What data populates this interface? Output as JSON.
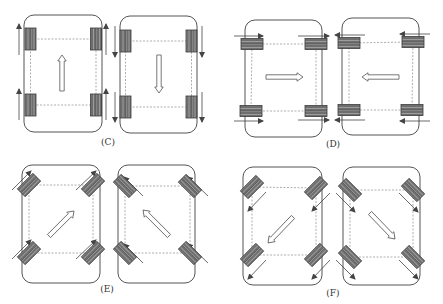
{
  "colors": {
    "frame": "#555555",
    "dashed": "#9a9a9a",
    "wheel_fill": "#6e6e6e",
    "wheel_stripe": "#9c9c9c",
    "wheel_stroke": "#3a3a3a",
    "motion_arrow": "#444444",
    "body_arrow_fill": "#ffffff",
    "body_arrow_stroke": "#555555"
  },
  "panels": [
    {
      "id": "C",
      "label": "(C)",
      "label_pos": [
        108,
        137
      ],
      "description": "Forward / backward motion, wheels straight",
      "robots": [
        {
          "frame": [
            24,
            15,
            78,
            117
          ],
          "wheel_angle": 0,
          "wheel_size": [
            11,
            22
          ],
          "wheels": [
            [
              30.5,
              39
            ],
            [
              96,
              39
            ],
            [
              30.5,
              105
            ],
            [
              96,
              105
            ]
          ],
          "motion_arrows": [
            {
              "from": [
                19,
                55
              ],
              "to": [
                19,
                24
              ]
            },
            {
              "from": [
                106,
                55
              ],
              "to": [
                106,
                24
              ]
            },
            {
              "from": [
                19,
                120
              ],
              "to": [
                19,
                89
              ]
            },
            {
              "from": [
                106,
                120
              ],
              "to": [
                106,
                89
              ]
            }
          ],
          "body_arrow": {
            "from": [
              62,
              91
            ],
            "to": [
              62,
              55
            ]
          }
        },
        {
          "frame": [
            120,
            16,
            77,
            117
          ],
          "wheel_angle": 0,
          "wheel_size": [
            11,
            22
          ],
          "wheels": [
            [
              125.5,
              41
            ],
            [
              191.5,
              41
            ],
            [
              125.5,
              107
            ],
            [
              191.5,
              107
            ]
          ],
          "motion_arrows": [
            {
              "from": [
                115,
                26
              ],
              "to": [
                115,
                57
              ]
            },
            {
              "from": [
                202,
                26
              ],
              "to": [
                202,
                57
              ]
            },
            {
              "from": [
                115,
                92
              ],
              "to": [
                115,
                122
              ]
            },
            {
              "from": [
                202,
                92
              ],
              "to": [
                202,
                122
              ]
            }
          ],
          "body_arrow": {
            "from": [
              159,
              55
            ],
            "to": [
              159,
              93
            ]
          }
        }
      ]
    },
    {
      "id": "D",
      "label": "(D)",
      "label_pos": [
        333,
        139
      ],
      "description": "Sideways motion, wheels turned 90 degrees",
      "robots": [
        {
          "frame": [
            245,
            20,
            77,
            117
          ],
          "wheel_angle": 90,
          "wheel_size": [
            11,
            22
          ],
          "wheels": [
            [
              252,
              44
            ],
            [
              316,
              44
            ],
            [
              251,
              111
            ],
            [
              316,
              111
            ]
          ],
          "motion_arrows": [
            {
              "from": [
                234,
                36
              ],
              "to": [
                263,
                36
              ]
            },
            {
              "from": [
                298,
                36
              ],
              "to": [
                329,
                36
              ]
            },
            {
              "from": [
                234,
                121
              ],
              "to": [
                263,
                121
              ]
            },
            {
              "from": [
                298,
                120
              ],
              "to": [
                329,
                120
              ]
            }
          ],
          "body_arrow": {
            "from": [
              266,
              77
            ],
            "to": [
              303,
              77
            ]
          }
        },
        {
          "frame": [
            342,
            18,
            77,
            117
          ],
          "wheel_angle": 90,
          "wheel_size": [
            11,
            22
          ],
          "wheels": [
            [
              349,
              43
            ],
            [
              413,
              42
            ],
            [
              349,
              110
            ],
            [
              412,
              110
            ]
          ],
          "motion_arrows": [
            {
              "from": [
                365,
                35
              ],
              "to": [
                335,
                35
              ]
            },
            {
              "from": [
                430,
                34
              ],
              "to": [
                400,
                34
              ]
            },
            {
              "from": [
                365,
                120
              ],
              "to": [
                335,
                120
              ]
            },
            {
              "from": [
                430,
                121
              ],
              "to": [
                400,
                121
              ]
            }
          ],
          "body_arrow": {
            "from": [
              399,
              77
            ],
            "to": [
              362,
              77
            ]
          }
        }
      ]
    },
    {
      "id": "E",
      "label": "(E)",
      "label_pos": [
        107,
        284
      ],
      "description": "Diagonal forward motion, wheels at 45 degrees",
      "robots": [
        {
          "frame": [
            22,
            165,
            78,
            118
          ],
          "wheel_angle": 45,
          "wheel_size": [
            11,
            22
          ],
          "wheels": [
            [
              29,
              185
            ],
            [
              93,
              185
            ],
            [
              29,
              253
            ],
            [
              93,
              253
            ]
          ],
          "motion_arrows": [
            {
              "from": [
                12,
                190
              ],
              "to": [
                31,
                171
              ]
            },
            {
              "from": [
                76,
                190
              ],
              "to": [
                96,
                171
              ]
            },
            {
              "from": [
                12,
                259
              ],
              "to": [
                31,
                240
              ]
            },
            {
              "from": [
                76,
                259
              ],
              "to": [
                96,
                240
              ]
            }
          ],
          "body_arrow": {
            "from": [
              49,
              236
            ],
            "to": [
              74,
              211
            ]
          }
        },
        {
          "frame": [
            118,
            165,
            77,
            118
          ],
          "wheel_angle": -45,
          "wheel_size": [
            11,
            22
          ],
          "wheels": [
            [
              125,
              186
            ],
            [
              190,
              186
            ],
            [
              125,
              253
            ],
            [
              190,
              253
            ]
          ],
          "motion_arrows": [
            {
              "from": [
                143,
                196
              ],
              "to": [
                124,
                177
              ]
            },
            {
              "from": [
                208,
                196
              ],
              "to": [
                188,
                177
              ]
            },
            {
              "from": [
                143,
                263
              ],
              "to": [
                124,
                244
              ]
            },
            {
              "from": [
                208,
                263
              ],
              "to": [
                188,
                244
              ]
            }
          ],
          "body_arrow": {
            "from": [
              169,
              236
            ],
            "to": [
              143,
              210
            ]
          }
        }
      ]
    },
    {
      "id": "F",
      "label": "(F)",
      "label_pos": [
        333,
        288
      ],
      "description": "Diagonal backward motion, wheels at 45 degrees",
      "robots": [
        {
          "frame": [
            243,
            167,
            79,
            118
          ],
          "wheel_angle": 45,
          "wheel_size": [
            11,
            22
          ],
          "wheels": [
            [
              252,
              187
            ],
            [
              316,
              188
            ],
            [
              252,
              255
            ],
            [
              316,
              255
            ]
          ],
          "motion_arrows": [
            {
              "from": [
                266,
                192
              ],
              "to": [
                248,
                211
              ]
            },
            {
              "from": [
                330,
                193
              ],
              "to": [
                312,
                211
              ]
            },
            {
              "from": [
                266,
                260
              ],
              "to": [
                248,
                279
              ]
            },
            {
              "from": [
                330,
                260
              ],
              "to": [
                312,
                279
              ]
            }
          ],
          "body_arrow": {
            "from": [
              293,
              217
            ],
            "to": [
              268,
              243
            ]
          }
        },
        {
          "frame": [
            343,
            167,
            77,
            118
          ],
          "wheel_angle": -45,
          "wheel_size": [
            11,
            22
          ],
          "wheels": [
            [
              350,
              190
            ],
            [
              413,
              190
            ],
            [
              350,
              257
            ],
            [
              413,
              257
            ]
          ],
          "motion_arrows": [
            {
              "from": [
                336,
                193
              ],
              "to": [
                355,
                212
              ]
            },
            {
              "from": [
                399,
                193
              ],
              "to": [
                418,
                212
              ]
            },
            {
              "from": [
                336,
                260
              ],
              "to": [
                355,
                279
              ]
            },
            {
              "from": [
                399,
                260
              ],
              "to": [
                418,
                279
              ]
            }
          ],
          "body_arrow": {
            "from": [
              370,
              213
            ],
            "to": [
              395,
              239
            ]
          }
        }
      ]
    }
  ]
}
